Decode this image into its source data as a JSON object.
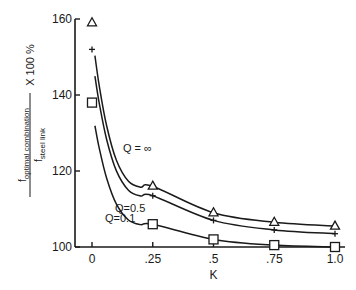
{
  "chart_data": {
    "type": "line",
    "title": "",
    "xlabel": "K",
    "ylabel": "f_optimal combination / f_steel link X 100 %",
    "ylabel_parts": {
      "numerator": "f",
      "numerator_sub": "optimal combination",
      "denominator": "f",
      "denominator_sub": "steel link",
      "suffix": "X 100 %"
    },
    "xlim": [
      0,
      1.0
    ],
    "ylim": [
      100,
      160
    ],
    "x_ticks": [
      0,
      0.25,
      0.5,
      0.75,
      1.0
    ],
    "x_tick_labels": [
      "0",
      ".25",
      ".5",
      ".75",
      "1.0"
    ],
    "y_ticks": [
      100,
      120,
      140,
      160
    ],
    "y_tick_labels": [
      "100",
      "120",
      "140",
      "160"
    ],
    "grid": false,
    "legend": "inline curve labels",
    "x": [
      0,
      0.25,
      0.5,
      0.75,
      1.0
    ],
    "series": [
      {
        "name": "Q = ∞",
        "marker": "triangle",
        "values": [
          159,
          116,
          109,
          106.5,
          105.5
        ]
      },
      {
        "name": "Q=0.5",
        "marker": "plus",
        "values": [
          152,
          113.5,
          107,
          104.5,
          103.5
        ]
      },
      {
        "name": "Q=0.1",
        "marker": "square",
        "values": [
          138,
          106,
          102,
          100.5,
          100
        ]
      }
    ]
  }
}
